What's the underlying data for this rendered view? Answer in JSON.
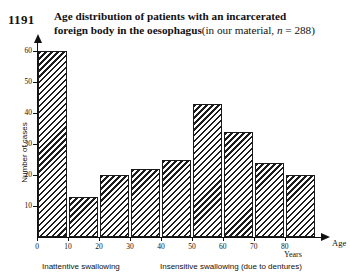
{
  "figure": {
    "number": "1191",
    "title_line1": "Age distribution of patients with an incarcerated",
    "title_line2_bold": "foreign body in the oesophagus",
    "title_line2_rest_a": "(in our material, ",
    "title_line2_italic_n": "n",
    "title_line2_rest_b": " = 288)"
  },
  "captions": {
    "left": "Inattentive swallowing",
    "right": "Insensitive swallowing (due to dentures)"
  },
  "chart_data": {
    "type": "bar",
    "xlabel": "Age",
    "xunit": "Years",
    "ylabel": "Number of cases",
    "xlim": [
      0,
      90
    ],
    "ylim": [
      0,
      64
    ],
    "grid": false,
    "legend": "none",
    "bin_width": 10,
    "bin_starts": [
      0,
      10,
      20,
      30,
      40,
      50,
      60,
      70,
      80
    ],
    "categories": [
      "0-10",
      "10-20",
      "20-30",
      "30-40",
      "40-50",
      "50-60",
      "60-70",
      "70-80",
      "80-90"
    ],
    "values": [
      60,
      13,
      20,
      22,
      25,
      43,
      34,
      24,
      20
    ],
    "xticks": [
      "0",
      "10",
      "20",
      "30",
      "40",
      "50",
      "60",
      "70",
      "80"
    ],
    "xtick_values": [
      0,
      10,
      20,
      30,
      40,
      50,
      60,
      70,
      80
    ],
    "yticks": [
      "10",
      "20",
      "30",
      "40",
      "50",
      "60"
    ],
    "ytick_values": [
      10,
      20,
      30,
      40,
      50,
      60
    ],
    "annotations": [
      {
        "text": "Inattentive swallowing",
        "span": [
          0,
          30
        ]
      },
      {
        "text": "Insensitive swallowing (due to dentures)",
        "span": [
          40,
          90
        ]
      }
    ],
    "total_n": 288
  }
}
